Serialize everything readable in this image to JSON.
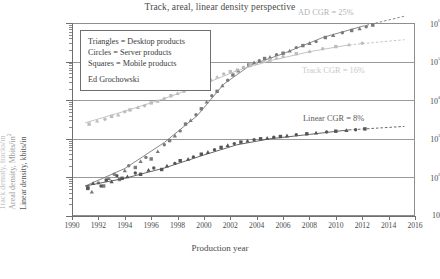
{
  "chart_data": {
    "type": "scatter",
    "title": "Track, areal, linear density perspective",
    "xlabel": "Production year",
    "ylabel_track": "Track density, tracks/in",
    "ylabel_areal": "Areal density, Mbits/in",
    "ylabel_areal_sup": "2",
    "ylabel_linear": "Linear density, kbits/in",
    "xlim": [
      1990,
      2016
    ],
    "ylim": [
      10,
      1000000
    ],
    "yscale": "log",
    "grid": true,
    "legend_position": "upper-left-inside",
    "xticks": [
      "1990",
      "1992",
      "1994",
      "1996",
      "1998",
      "2000",
      "2002",
      "2004",
      "2006",
      "2008",
      "2010",
      "2012",
      "2014",
      "2016"
    ],
    "yticks": [
      "10",
      "10²",
      "10³",
      "10⁴",
      "10⁵",
      "10⁶"
    ],
    "ytick_values": [
      10,
      100,
      1000,
      10000,
      100000,
      1000000
    ],
    "annotations": [
      {
        "text": "AD CGR = 25%",
        "color": "#b4b4b4"
      },
      {
        "text": "Track CGR = 16%",
        "color": "#c9c9c9"
      },
      {
        "text": "Linear CGR = 8%",
        "color": "#5a5a5a"
      }
    ],
    "legend": {
      "lines": [
        "Triangles = Desktop products",
        "Circles = Server products",
        "Squares = Mobile products"
      ],
      "author": "Ed Grochowski"
    },
    "series": [
      {
        "name": "Areal density",
        "color": "#7a7a7a",
        "unit": "Mbits/in^2",
        "cgr_percent": 25,
        "fit": [
          [
            1991.0,
            60
          ],
          [
            1994.0,
            170
          ],
          [
            1997.0,
            800
          ],
          [
            1999.5,
            4000
          ],
          [
            2001.5,
            26000
          ],
          [
            2003.5,
            80000
          ],
          [
            2006.0,
            160000
          ],
          [
            2009.0,
            420000
          ],
          [
            2012.0,
            820000
          ]
        ],
        "fit_dashed": [
          [
            2012.0,
            820000
          ],
          [
            2015.2,
            1500000
          ]
        ],
        "points": [
          [
            1991.2,
            55
          ],
          [
            1991.5,
            42
          ],
          [
            1992.0,
            72
          ],
          [
            1992.4,
            60
          ],
          [
            1992.8,
            95
          ],
          [
            1993.2,
            120
          ],
          [
            1993.6,
            88
          ],
          [
            1994.0,
            150
          ],
          [
            1994.3,
            200
          ],
          [
            1994.8,
            180
          ],
          [
            1995.2,
            260
          ],
          [
            1995.6,
            330
          ],
          [
            1996.0,
            300
          ],
          [
            1996.5,
            470
          ],
          [
            1997.0,
            700
          ],
          [
            1997.4,
            900
          ],
          [
            1997.8,
            1200
          ],
          [
            1998.2,
            1600
          ],
          [
            1998.6,
            2400
          ],
          [
            1999.0,
            3000
          ],
          [
            1999.4,
            4200
          ],
          [
            1999.8,
            6000
          ],
          [
            2000.2,
            9000
          ],
          [
            2000.6,
            13000
          ],
          [
            2001.0,
            17000
          ],
          [
            2001.4,
            24000
          ],
          [
            2001.8,
            33000
          ],
          [
            2002.2,
            45000
          ],
          [
            2002.6,
            58000
          ],
          [
            2003.0,
            70000
          ],
          [
            2003.4,
            82000
          ],
          [
            2003.8,
            95000
          ],
          [
            2004.2,
            105000
          ],
          [
            2004.6,
            120000
          ],
          [
            2005.0,
            130000
          ],
          [
            2005.5,
            150000
          ],
          [
            2006.0,
            165000
          ],
          [
            2006.5,
            190000
          ],
          [
            2007.0,
            230000
          ],
          [
            2007.5,
            260000
          ],
          [
            2008.0,
            300000
          ],
          [
            2008.5,
            330000
          ],
          [
            2009.2,
            420000
          ],
          [
            2009.8,
            480000
          ],
          [
            2010.5,
            560000
          ],
          [
            2011.2,
            640000
          ],
          [
            2011.8,
            720000
          ],
          [
            2012.3,
            800000
          ],
          [
            2012.8,
            880000
          ]
        ]
      },
      {
        "name": "Track density",
        "color": "#bdbdbd",
        "unit": "tracks/in",
        "cgr_percent": 16,
        "fit": [
          [
            1991.0,
            2600
          ],
          [
            1994.0,
            5200
          ],
          [
            1997.0,
            11000
          ],
          [
            2000.0,
            26000
          ],
          [
            2002.5,
            58000
          ],
          [
            2005.0,
            105000
          ],
          [
            2008.0,
            180000
          ],
          [
            2011.0,
            270000
          ]
        ],
        "fit_dashed": [
          [
            2011.0,
            270000
          ],
          [
            2015.2,
            370000
          ]
        ],
        "points": [
          [
            1991.3,
            2400
          ],
          [
            1991.9,
            2900
          ],
          [
            1992.5,
            3200
          ],
          [
            1993.0,
            3800
          ],
          [
            1993.5,
            4200
          ],
          [
            1994.0,
            5000
          ],
          [
            1994.4,
            5600
          ],
          [
            1995.0,
            6500
          ],
          [
            1995.5,
            7200
          ],
          [
            1996.0,
            8500
          ],
          [
            1996.5,
            9500
          ],
          [
            1997.0,
            11000
          ],
          [
            1997.5,
            13000
          ],
          [
            1998.0,
            15000
          ],
          [
            1998.5,
            17000
          ],
          [
            1999.0,
            20000
          ],
          [
            1999.5,
            23000
          ],
          [
            2000.0,
            27000
          ],
          [
            2000.5,
            33000
          ],
          [
            2001.0,
            40000
          ],
          [
            2001.5,
            48000
          ],
          [
            2002.0,
            55000
          ],
          [
            2002.5,
            62000
          ],
          [
            2003.0,
            72000
          ],
          [
            2003.5,
            82000
          ],
          [
            2004.0,
            90000
          ],
          [
            2004.5,
            100000
          ],
          [
            2005.0,
            110000
          ],
          [
            2005.5,
            125000
          ],
          [
            2006.0,
            135000
          ],
          [
            2007.0,
            160000
          ],
          [
            2008.0,
            185000
          ],
          [
            2009.0,
            215000
          ],
          [
            2010.0,
            245000
          ],
          [
            2011.0,
            275000
          ],
          [
            2012.0,
            300000
          ]
        ]
      },
      {
        "name": "Linear density",
        "color": "#555555",
        "unit": "kbits/in",
        "cgr_percent": 8,
        "fit": [
          [
            1991.0,
            60
          ],
          [
            1994.0,
            95
          ],
          [
            1997.0,
            175
          ],
          [
            2000.0,
            380
          ],
          [
            2002.5,
            700
          ],
          [
            2005.0,
            1000
          ],
          [
            2008.0,
            1300
          ],
          [
            2011.0,
            1700
          ]
        ],
        "fit_dashed": [
          [
            2011.0,
            1700
          ],
          [
            2015.2,
            2100
          ]
        ],
        "points": [
          [
            1991.2,
            52
          ],
          [
            1991.6,
            70
          ],
          [
            1992.2,
            60
          ],
          [
            1992.6,
            85
          ],
          [
            1993.0,
            78
          ],
          [
            1993.4,
            110
          ],
          [
            1993.8,
            95
          ],
          [
            1994.2,
            105
          ],
          [
            1994.8,
            130
          ],
          [
            1995.2,
            120
          ],
          [
            1995.8,
            155
          ],
          [
            1996.2,
            175
          ],
          [
            1996.8,
            160
          ],
          [
            1997.2,
            200
          ],
          [
            1997.8,
            230
          ],
          [
            1998.2,
            270
          ],
          [
            1998.8,
            300
          ],
          [
            1999.2,
            340
          ],
          [
            1999.8,
            400
          ],
          [
            2000.3,
            450
          ],
          [
            2000.8,
            520
          ],
          [
            2001.3,
            600
          ],
          [
            2001.8,
            680
          ],
          [
            2002.3,
            750
          ],
          [
            2002.8,
            820
          ],
          [
            2003.3,
            880
          ],
          [
            2003.8,
            950
          ],
          [
            2004.3,
            1000
          ],
          [
            2004.8,
            1050
          ],
          [
            2005.3,
            1100
          ],
          [
            2005.8,
            1150
          ],
          [
            2006.3,
            1200
          ],
          [
            2007.0,
            1280
          ],
          [
            2007.8,
            1350
          ],
          [
            2008.5,
            1420
          ],
          [
            2009.3,
            1500
          ],
          [
            2010.0,
            1570
          ],
          [
            2010.8,
            1650
          ],
          [
            2011.5,
            1720
          ],
          [
            2012.2,
            1800
          ]
        ]
      }
    ]
  }
}
